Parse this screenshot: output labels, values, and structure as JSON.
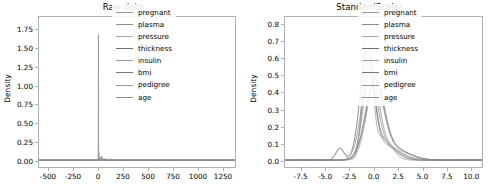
{
  "figure": {
    "width": 493,
    "height": 194,
    "background": "#ffffff",
    "axes_border_color": "#b0b0b0"
  },
  "chart_data": [
    {
      "type": "line",
      "title": "Raw data",
      "xlabel": "",
      "ylabel": "Density",
      "xlim": [
        -600,
        1380
      ],
      "ylim": [
        -0.09,
        1.92
      ],
      "xticks": [
        -500,
        -250,
        0,
        250,
        500,
        750,
        1000,
        1250
      ],
      "xticklabels": [
        "-500",
        "-250",
        "0",
        "250",
        "500",
        "750",
        "1000",
        "1250"
      ],
      "yticks": [
        0.0,
        0.25,
        0.5,
        0.75,
        1.0,
        1.25,
        1.5,
        1.75
      ],
      "yticklabels": [
        "0.00",
        "0.25",
        "0.50",
        "0.75",
        "1.00",
        "1.25",
        "1.50",
        "1.75"
      ],
      "grid": false,
      "legend_position": "upper right",
      "series": [
        {
          "name": "pregnant",
          "color": "#9a9a9a",
          "kde_mean": 3.8,
          "kde_sigma": 3.4,
          "peak": 0.118
        },
        {
          "name": "plasma",
          "color": "#8c8c8c",
          "kde_mean": 120.9,
          "kde_sigma": 32.0,
          "peak": 0.0125
        },
        {
          "name": "pressure",
          "color": "#a6a6a6",
          "kde_mean": 69.1,
          "kde_sigma": 19.4,
          "peak": 0.0206
        },
        {
          "name": "thickness",
          "color": "#6e6e6e",
          "kde_mean": 20.5,
          "kde_sigma": 16.0,
          "peak": 0.025
        },
        {
          "name": "insulin",
          "color": "#9f9f9f",
          "kde_mean": 79.8,
          "kde_sigma": 115.2,
          "peak": 0.0046
        },
        {
          "name": "bmi",
          "color": "#777777",
          "kde_mean": 32.0,
          "kde_sigma": 7.9,
          "peak": 0.0505
        },
        {
          "name": "pedigree",
          "color": "#959595",
          "kde_mean": 0.47,
          "kde_sigma": 0.33,
          "peak": 1.82
        },
        {
          "name": "age",
          "color": "#8f8f8f",
          "kde_mean": 33.2,
          "kde_sigma": 11.8,
          "peak": 0.034
        }
      ],
      "notes": "Unscaled feature KDEs; pedigree forms a very tall narrow spike near x=0 reaching ~1.82, all other features are nearly flat at the baseline with a small mound between 0 and 150."
    },
    {
      "type": "line",
      "title": "StandardScaler",
      "xlabel": "",
      "ylabel": "Density",
      "xlim": [
        -9.2,
        11.2
      ],
      "ylim": [
        -0.04,
        0.845
      ],
      "xticks": [
        -7.5,
        -5.0,
        -2.5,
        0.0,
        2.5,
        5.0,
        7.5,
        10.0
      ],
      "xticklabels": [
        "-7.5",
        "-5.0",
        "-2.5",
        "0.0",
        "2.5",
        "5.0",
        "7.5",
        "10.0"
      ],
      "yticks": [
        0.0,
        0.1,
        0.2,
        0.3,
        0.4,
        0.5,
        0.6,
        0.7,
        0.8
      ],
      "yticklabels": [
        "0.0",
        "0.1",
        "0.2",
        "0.3",
        "0.4",
        "0.5",
        "0.6",
        "0.7",
        "0.8"
      ],
      "grid": false,
      "legend_position": "upper right",
      "series": [
        {
          "name": "pregnant",
          "color": "#9a9a9a",
          "kde_mean": -0.55,
          "kde_sigma": 0.62,
          "peak": 0.53
        },
        {
          "name": "plasma",
          "color": "#8c8c8c",
          "kde_mean": 0.12,
          "kde_sigma": 0.92,
          "peak": 0.42
        },
        {
          "name": "pressure",
          "color": "#a6a6a6",
          "kde_mean": 0.16,
          "kde_sigma": 0.86,
          "peak": 0.44
        },
        {
          "name": "thickness",
          "color": "#6e6e6e",
          "kde_mean": -0.72,
          "kde_sigma": 0.7,
          "peak": 0.6
        },
        {
          "name": "insulin",
          "color": "#9f9f9f",
          "kde_mean": -0.66,
          "kde_sigma": 0.48,
          "peak": 0.79
        },
        {
          "name": "bmi",
          "color": "#777777",
          "kde_mean": 0.04,
          "kde_sigma": 0.9,
          "peak": 0.43
        },
        {
          "name": "pedigree",
          "color": "#959595",
          "kde_mean": -0.3,
          "kde_sigma": 0.76,
          "peak": 0.5
        },
        {
          "name": "age",
          "color": "#8f8f8f",
          "kde_mean": -0.48,
          "kde_sigma": 0.8,
          "peak": 0.47
        }
      ],
      "notes": "Standardized features; overlapping bell curves peaking between 0.4 and 0.8 around x = -1 to 0.5, with a small secondary bump near x = -3.5 of height ~0.07 and long right tails out to x ~ 5."
    }
  ],
  "legend": {
    "entries": [
      {
        "label": "pregnant",
        "color": "#9a9a9a"
      },
      {
        "label": "plasma",
        "color": "#8c8c8c"
      },
      {
        "label": "pressure",
        "color": "#a6a6a6"
      },
      {
        "label": "thickness",
        "color": "#6e6e6e"
      },
      {
        "label": "insulin",
        "color": "#9f9f9f"
      },
      {
        "label": "bmi",
        "color": "#777777"
      },
      {
        "label": "pedigree",
        "color": "#959595"
      },
      {
        "label": "age",
        "color": "#8f8f8f"
      }
    ]
  }
}
